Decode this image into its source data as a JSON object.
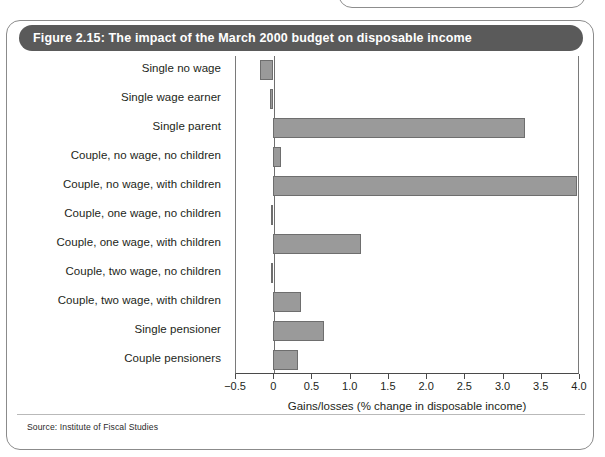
{
  "figure": {
    "title": "Figure 2.15: The impact of the March 2000 budget on disposable income",
    "source": "Source: Institute of Fiscal Studies",
    "title_bar_color": "#5a5a5a",
    "card_border_color": "#8b8b8b",
    "bar_fill_color": "#9a9a9a",
    "bar_edge_color": "#6e6e6e"
  },
  "chart_data": {
    "type": "bar",
    "orientation": "horizontal",
    "title": "Figure 2.15: The impact of the March 2000 budget on disposable income",
    "xlabel": "Gains/losses (% change in disposable income)",
    "ylabel": "",
    "xlim": [
      -0.5,
      4.0
    ],
    "xticks": [
      -0.5,
      0,
      0.5,
      1.0,
      1.5,
      2.0,
      2.5,
      3.0,
      3.5,
      4.0
    ],
    "xticklabels": [
      "−0.5",
      "0",
      "0.5",
      "1.0",
      "1.5",
      "2.0",
      "2.5",
      "3.0",
      "3.5",
      "4.0"
    ],
    "grid": false,
    "legend": null,
    "categories": [
      "Single no wage",
      "Single wage earner",
      "Single parent",
      "Couple, no wage, no children",
      "Couple, no wage, with children",
      "Couple, one wage, no children",
      "Couple, one wage, with children",
      "Couple, two wage, no children",
      "Couple, two wage, with children",
      "Single pensioner",
      "Couple pensioners"
    ],
    "values": [
      -0.17,
      -0.04,
      3.3,
      0.1,
      3.98,
      -0.03,
      1.15,
      -0.03,
      0.36,
      0.67,
      0.33
    ]
  }
}
